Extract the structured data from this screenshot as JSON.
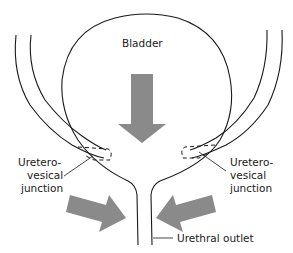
{
  "diagram": {
    "labels": {
      "bladder": "Bladder",
      "left_junction": [
        "Uretero-",
        "vesical",
        "junction"
      ],
      "right_junction": [
        "Uretero-",
        "vesical",
        "junction"
      ],
      "urethral_outlet": "Urethral outlet"
    },
    "colors": {
      "line": "#1a1a1a",
      "arrow": "#8a8a8a",
      "background": "#ffffff"
    },
    "arrows": [
      {
        "id": "central-pressure",
        "direction": "down"
      },
      {
        "id": "left-compression",
        "direction": "down-right"
      },
      {
        "id": "right-compression",
        "direction": "down-left"
      }
    ]
  }
}
